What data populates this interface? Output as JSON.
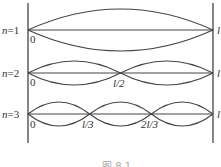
{
  "figure": {
    "caption": "图 8.1",
    "walls": {
      "left_x": 28,
      "right_x": 213,
      "top_y": 3,
      "bottom_y": 143
    },
    "line_color": "#444444",
    "modes": [
      {
        "n": 1,
        "label": "n=1",
        "axis_y": 30,
        "amplitude": 21,
        "origin_label": "0",
        "node_labels": []
      },
      {
        "n": 2,
        "label": "n=2",
        "axis_y": 73,
        "amplitude": 12,
        "origin_label": "0",
        "node_labels": [
          "l/2"
        ]
      },
      {
        "n": 3,
        "label": "n=3",
        "axis_y": 114,
        "amplitude": 12,
        "origin_label": "0",
        "node_labels": [
          "l/3",
          "2l/3"
        ]
      }
    ],
    "right_edge_labels": [
      "l",
      "l",
      "l"
    ]
  }
}
